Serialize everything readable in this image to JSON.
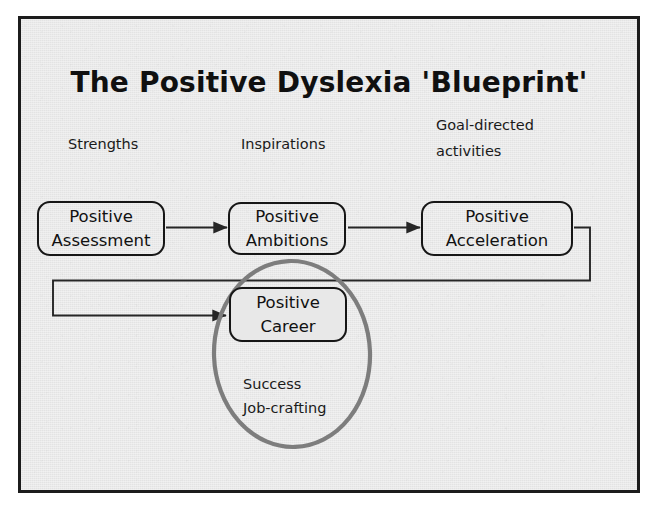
{
  "slide": {
    "title": "The Positive Dyslexia 'Blueprint'",
    "background_color": "#e8e8e8",
    "border_color": "#1c1c1c"
  },
  "column_labels": [
    {
      "name": "strengths",
      "text": "Strengths"
    },
    {
      "name": "inspirations",
      "text": "Inspirations"
    },
    {
      "name": "goal-directed-activities",
      "text": "Goal-directed activities"
    }
  ],
  "nodes": [
    {
      "name": "positive-assessment",
      "line1": "Positive",
      "line2": "Assessment"
    },
    {
      "name": "positive-ambitions",
      "line1": "Positive",
      "line2": "Ambitions"
    },
    {
      "name": "positive-acceleration",
      "line1": "Positive",
      "line2": "Acceleration"
    },
    {
      "name": "positive-career",
      "line1": "Positive",
      "line2": "Career"
    }
  ],
  "highlight": {
    "shape": "ellipse",
    "stroke_color": "#7d7d7d",
    "notes": [
      {
        "name": "success",
        "text": "Success"
      },
      {
        "name": "job-crafting",
        "text": "Job-crafting"
      }
    ]
  },
  "connectors": {
    "stroke_color": "#262626",
    "items": [
      {
        "name": "assessment-to-ambitions",
        "style": "arrow"
      },
      {
        "name": "ambitions-to-acceleration",
        "style": "arrow"
      },
      {
        "name": "acceleration-to-career-feedback-loop",
        "style": "arrow"
      }
    ]
  }
}
